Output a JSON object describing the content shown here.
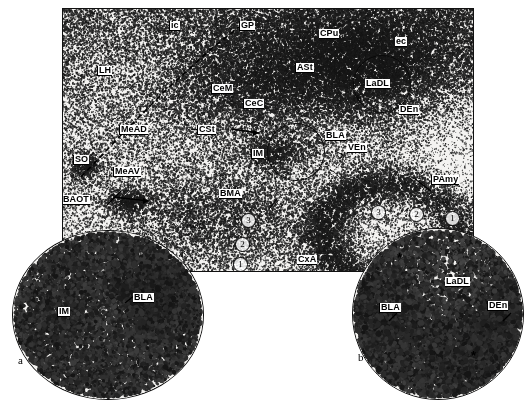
{
  "figure": {
    "type": "autoradiograph-brain-section",
    "panel_letters": [
      {
        "id": "a",
        "text": "a"
      },
      {
        "id": "b",
        "text": "b"
      }
    ]
  },
  "main_panel": {
    "labels": [
      {
        "id": "ic",
        "text": "ic"
      },
      {
        "id": "gp",
        "text": "GP"
      },
      {
        "id": "cpu",
        "text": "CPu"
      },
      {
        "id": "ec",
        "text": "ec"
      },
      {
        "id": "lh",
        "text": "LH"
      },
      {
        "id": "cem",
        "text": "CeM"
      },
      {
        "id": "cec",
        "text": "CeC"
      },
      {
        "id": "ast",
        "text": "ASt"
      },
      {
        "id": "ladl",
        "text": "LaDL"
      },
      {
        "id": "den",
        "text": "DEn"
      },
      {
        "id": "mead",
        "text": "MeAD"
      },
      {
        "id": "cst",
        "text": "CSt"
      },
      {
        "id": "bla",
        "text": "BLA"
      },
      {
        "id": "im",
        "text": "IM"
      },
      {
        "id": "ven",
        "text": "VEn"
      },
      {
        "id": "so",
        "text": "SO"
      },
      {
        "id": "meav",
        "text": "MeAV"
      },
      {
        "id": "bmaot",
        "text": "BAOT"
      },
      {
        "id": "bma",
        "text": "BMA"
      },
      {
        "id": "pamy",
        "text": "PAmy"
      },
      {
        "id": "aco",
        "text": "ACo"
      },
      {
        "id": "cxa",
        "text": "CxA"
      }
    ],
    "roi_markers": [
      {
        "id": "roi-a",
        "text": "a"
      },
      {
        "id": "roi-b",
        "text": "b"
      }
    ],
    "circled_numbers_left": [
      "3",
      "2",
      "1"
    ],
    "circled_numbers_right": [
      "3",
      "2",
      "1"
    ]
  },
  "inset_a": {
    "letter": "a",
    "labels": [
      {
        "id": "im",
        "text": "IM"
      },
      {
        "id": "bla",
        "text": "BLA"
      }
    ]
  },
  "inset_b": {
    "letter": "b",
    "labels": [
      {
        "id": "ladl",
        "text": "LaDL"
      },
      {
        "id": "bla",
        "text": "BLA"
      },
      {
        "id": "den",
        "text": "DEn"
      }
    ],
    "asterisks": [
      "*",
      "*"
    ]
  },
  "colors": {
    "ink": "#000000",
    "panel_border": "#111111",
    "film_base": "#f2f2f2",
    "grain_dark": "#101010"
  }
}
